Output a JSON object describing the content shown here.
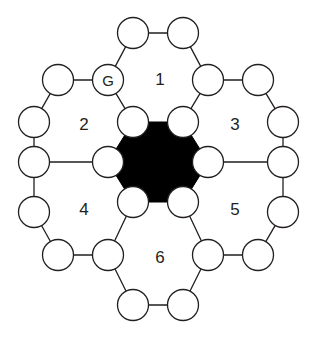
{
  "figure": {
    "type": "hexagonal-ring-diagram",
    "width": 322,
    "height": 338,
    "background_color": "#ffffff",
    "stroke_color": "#231f20",
    "node_fill": "#ffffff",
    "core_fill": "#000000",
    "node_radius": 15.5,
    "core_hex_radius": 52
  },
  "core": {
    "name": "central-filled-hexagon",
    "center": {
      "x": 158,
      "y": 162
    },
    "fill": "#000000",
    "vertices": [
      {
        "x": 133,
        "y": 122
      },
      {
        "x": 183,
        "y": 122
      },
      {
        "x": 208,
        "y": 162
      },
      {
        "x": 183,
        "y": 202
      },
      {
        "x": 133,
        "y": 202
      },
      {
        "x": 108,
        "y": 162
      }
    ]
  },
  "nodes": [
    {
      "id": "n1",
      "label": "",
      "x": 133,
      "y": 33,
      "named": false
    },
    {
      "id": "n2",
      "label": "",
      "x": 183,
      "y": 33,
      "named": false
    },
    {
      "id": "n3",
      "label": "G",
      "x": 108,
      "y": 80,
      "named": true
    },
    {
      "id": "n4",
      "label": "",
      "x": 208,
      "y": 80,
      "named": false
    },
    {
      "id": "n5",
      "label": "",
      "x": 58,
      "y": 80,
      "named": false
    },
    {
      "id": "n6",
      "label": "",
      "x": 258,
      "y": 80,
      "named": false
    },
    {
      "id": "n7",
      "label": "",
      "x": 34,
      "y": 122,
      "named": false
    },
    {
      "id": "n8",
      "label": "",
      "x": 133,
      "y": 122,
      "named": false
    },
    {
      "id": "n9",
      "label": "",
      "x": 183,
      "y": 122,
      "named": false
    },
    {
      "id": "n10",
      "label": "",
      "x": 283,
      "y": 122,
      "named": false
    },
    {
      "id": "n11",
      "label": "",
      "x": 34,
      "y": 162,
      "named": false
    },
    {
      "id": "n12",
      "label": "",
      "x": 108,
      "y": 162,
      "named": false
    },
    {
      "id": "n13",
      "label": "",
      "x": 208,
      "y": 162,
      "named": false
    },
    {
      "id": "n14",
      "label": "",
      "x": 283,
      "y": 162,
      "named": false
    },
    {
      "id": "n15",
      "label": "",
      "x": 34,
      "y": 212,
      "named": false
    },
    {
      "id": "n16",
      "label": "",
      "x": 133,
      "y": 202,
      "named": false
    },
    {
      "id": "n17",
      "label": "",
      "x": 183,
      "y": 202,
      "named": false
    },
    {
      "id": "n18",
      "label": "",
      "x": 283,
      "y": 212,
      "named": false
    },
    {
      "id": "n19",
      "label": "",
      "x": 58,
      "y": 255,
      "named": false
    },
    {
      "id": "n20",
      "label": "",
      "x": 108,
      "y": 255,
      "named": false
    },
    {
      "id": "n21",
      "label": "",
      "x": 208,
      "y": 255,
      "named": false
    },
    {
      "id": "n22",
      "label": "",
      "x": 258,
      "y": 255,
      "named": false
    },
    {
      "id": "n23",
      "label": "",
      "x": 133,
      "y": 305,
      "named": false
    },
    {
      "id": "n24",
      "label": "",
      "x": 183,
      "y": 305,
      "named": false
    }
  ],
  "edges": [
    {
      "from": "n1",
      "to": "n2"
    },
    {
      "from": "n1",
      "to": "n3"
    },
    {
      "from": "n2",
      "to": "n4"
    },
    {
      "from": "n3",
      "to": "n5"
    },
    {
      "from": "n4",
      "to": "n6"
    },
    {
      "from": "n3",
      "to": "n8"
    },
    {
      "from": "n4",
      "to": "n9"
    },
    {
      "from": "n5",
      "to": "n7"
    },
    {
      "from": "n6",
      "to": "n10"
    },
    {
      "from": "n7",
      "to": "n11"
    },
    {
      "from": "n10",
      "to": "n14"
    },
    {
      "from": "n11",
      "to": "n12"
    },
    {
      "from": "n13",
      "to": "n14"
    },
    {
      "from": "n11",
      "to": "n15"
    },
    {
      "from": "n14",
      "to": "n18"
    },
    {
      "from": "n12",
      "to": "n16"
    },
    {
      "from": "n13",
      "to": "n17"
    },
    {
      "from": "n15",
      "to": "n19"
    },
    {
      "from": "n18",
      "to": "n22"
    },
    {
      "from": "n19",
      "to": "n20"
    },
    {
      "from": "n21",
      "to": "n22"
    },
    {
      "from": "n20",
      "to": "n16"
    },
    {
      "from": "n17",
      "to": "n21"
    },
    {
      "from": "n20",
      "to": "n23"
    },
    {
      "from": "n21",
      "to": "n24"
    },
    {
      "from": "n23",
      "to": "n24"
    }
  ],
  "ring_labels": [
    {
      "id": "ring-1",
      "text": "1",
      "x": 160,
      "y": 79
    },
    {
      "id": "ring-2",
      "text": "2",
      "x": 84,
      "y": 124
    },
    {
      "id": "ring-3",
      "text": "3",
      "x": 235,
      "y": 124
    },
    {
      "id": "ring-4",
      "text": "4",
      "x": 84,
      "y": 209
    },
    {
      "id": "ring-5",
      "text": "5",
      "x": 235,
      "y": 209
    },
    {
      "id": "ring-6",
      "text": "6",
      "x": 160,
      "y": 257
    }
  ]
}
